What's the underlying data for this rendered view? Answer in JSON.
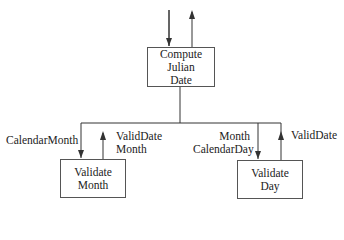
{
  "modules": {
    "top": {
      "lines": [
        "Compute",
        "Julian",
        "Date"
      ]
    },
    "left": {
      "lines": [
        "Validate",
        "Month"
      ]
    },
    "right": {
      "lines": [
        "Validate",
        "Day"
      ]
    }
  },
  "flows": {
    "left_down": "CalendarMonth",
    "left_up": [
      "ValidDate",
      "Month"
    ],
    "right_down": [
      "Month",
      "CalendarDay"
    ],
    "right_up": "ValidDate"
  },
  "colors": {
    "line": "#333333",
    "box_border": "#555555"
  }
}
